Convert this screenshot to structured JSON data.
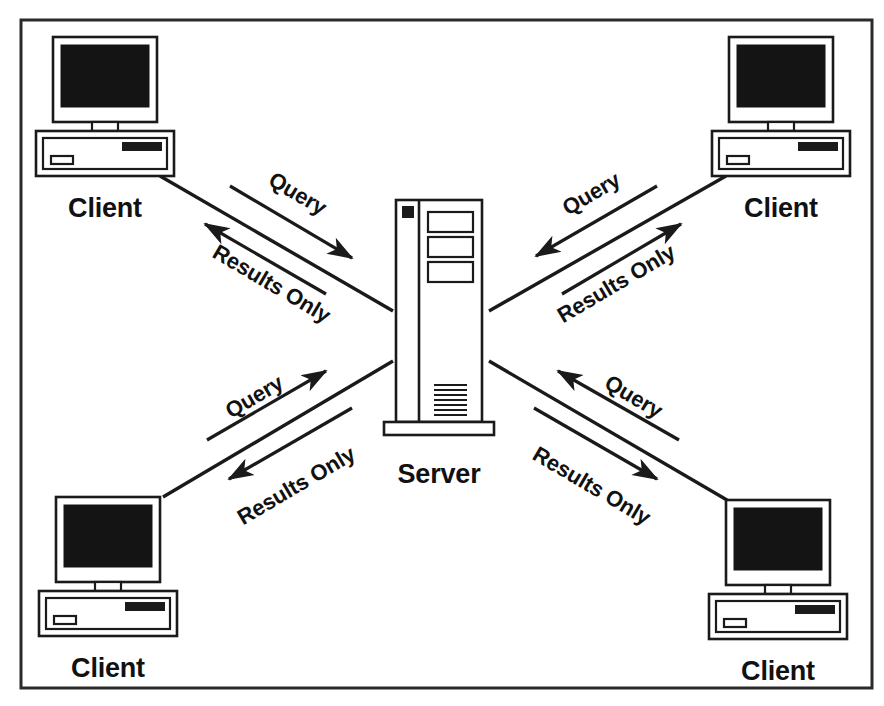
{
  "diagram": {
    "type": "network-topology",
    "background_color": "#ffffff",
    "line_color": "#1a1a1a",
    "frame_color": "#2b2b2b",
    "screen_color": "#141414"
  },
  "server": {
    "label": "Server",
    "id": "central-server",
    "position": "center",
    "features": {
      "power_led": "power-led",
      "drive_bays": 3,
      "vent_lines": 8
    }
  },
  "clients": [
    {
      "id": "client-top-left",
      "label": "Client",
      "position": "top-left"
    },
    {
      "id": "client-top-right",
      "label": "Client",
      "position": "top-right"
    },
    {
      "id": "client-bottom-left",
      "label": "Client",
      "position": "bottom-left"
    },
    {
      "id": "client-bottom-right",
      "label": "Client",
      "position": "bottom-right"
    }
  ],
  "flows": [
    {
      "id": "flow-top-left-query",
      "label": "Query",
      "from": "client-top-left",
      "to": "central-server",
      "direction": "client-to-server"
    },
    {
      "id": "flow-top-left-results",
      "label": "Results Only",
      "from": "central-server",
      "to": "client-top-left",
      "direction": "server-to-client"
    },
    {
      "id": "flow-top-right-query",
      "label": "Query",
      "from": "client-top-right",
      "to": "central-server",
      "direction": "client-to-server"
    },
    {
      "id": "flow-top-right-results",
      "label": "Results Only",
      "from": "central-server",
      "to": "client-top-right",
      "direction": "server-to-client"
    },
    {
      "id": "flow-bottom-left-query",
      "label": "Query",
      "from": "client-bottom-left",
      "to": "central-server",
      "direction": "client-to-server"
    },
    {
      "id": "flow-bottom-left-results",
      "label": "Results Only",
      "from": "central-server",
      "to": "client-bottom-left",
      "direction": "server-to-client"
    },
    {
      "id": "flow-bottom-right-query",
      "label": "Query",
      "from": "client-bottom-right",
      "to": "central-server",
      "direction": "client-to-server"
    },
    {
      "id": "flow-bottom-right-results",
      "label": "Results Only",
      "from": "central-server",
      "to": "client-bottom-right",
      "direction": "server-to-client"
    }
  ]
}
